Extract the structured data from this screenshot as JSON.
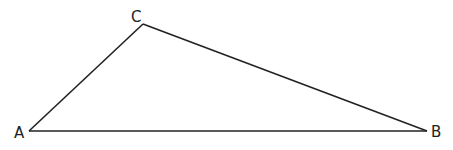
{
  "diagram": {
    "type": "triangle",
    "stroke_color": "#222222",
    "background": "#ffffff",
    "vertices": [
      {
        "name": "A",
        "x": 29,
        "y": 131,
        "label_x": 14,
        "label_y": 138
      },
      {
        "name": "B",
        "x": 427,
        "y": 131,
        "label_x": 431,
        "label_y": 137
      },
      {
        "name": "C",
        "x": 143,
        "y": 24,
        "label_x": 131,
        "label_y": 22
      }
    ],
    "edges": [
      {
        "from": "A",
        "to": "B",
        "name": "AB"
      },
      {
        "from": "B",
        "to": "C",
        "name": "BC"
      },
      {
        "from": "C",
        "to": "A",
        "name": "CA"
      }
    ]
  }
}
